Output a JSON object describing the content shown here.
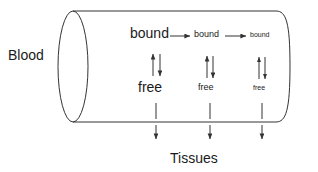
{
  "diagram": {
    "stroke_color": "#333333",
    "text_color": "#1a1a1a",
    "background_color": "#ffffff",
    "compartment_label": "Blood",
    "target_label": "Tissues",
    "columns": [
      {
        "bound_label": "bound",
        "free_label": "free",
        "x": 156
      },
      {
        "bound_label": "bound",
        "free_label": "free",
        "x": 210
      },
      {
        "bound_label": "bound",
        "free_label": "free",
        "x": 262
      }
    ],
    "cylinder": {
      "left_cap_center_x": 73,
      "left_cap_rx": 15,
      "top_y": 11,
      "bottom_y": 122,
      "right_x": 290
    }
  }
}
